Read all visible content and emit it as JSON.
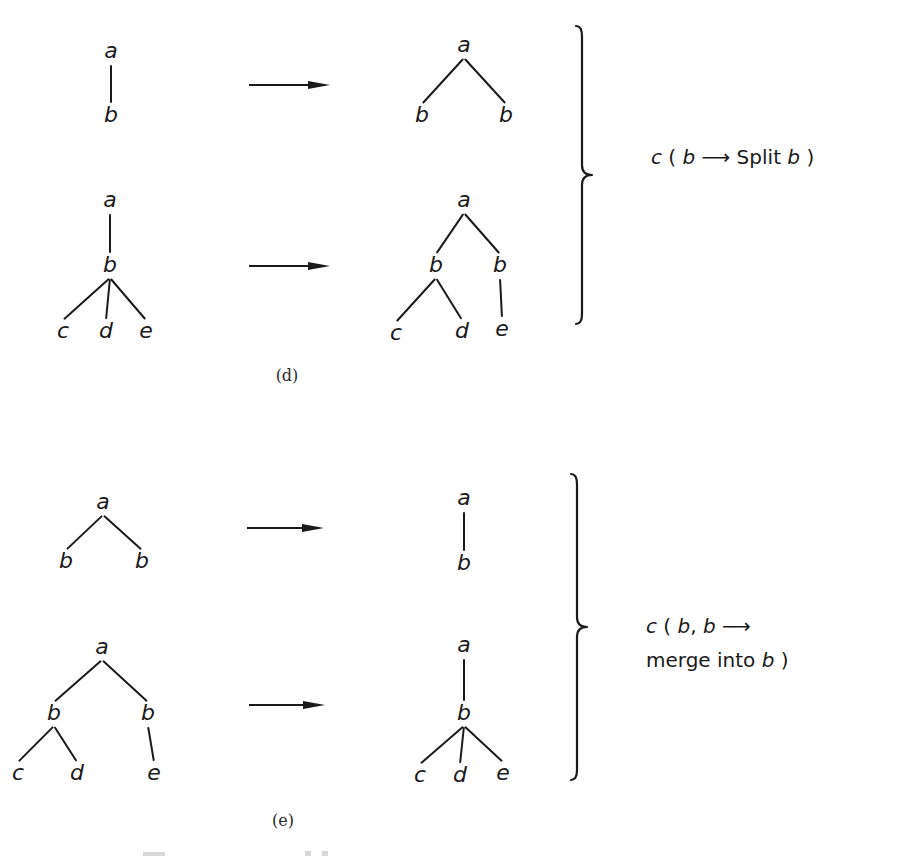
{
  "figure": {
    "panels": [
      {
        "id": "d",
        "label": "(d)",
        "rule": {
          "lines": [
            [
              {
                "text": "c",
                "italic": true
              },
              {
                "text": " ( ",
                "italic": false
              },
              {
                "text": "b",
                "italic": true
              },
              {
                "text": " ",
                "italic": false
              },
              {
                "text": "→",
                "italic": false,
                "arrow": true
              },
              {
                "text": " Split ",
                "italic": false
              },
              {
                "text": "b",
                "italic": true
              },
              {
                "text": " )",
                "italic": false
              }
            ]
          ],
          "plain": "c ( b → Split b )"
        },
        "transformations": [
          {
            "before": {
              "nodes": [
                {
                  "id": "a",
                  "label": "a"
                },
                {
                  "id": "b",
                  "label": "b"
                }
              ],
              "edges": [
                [
                  "a",
                  "b"
                ]
              ]
            },
            "after": {
              "nodes": [
                {
                  "id": "a",
                  "label": "a"
                },
                {
                  "id": "b1",
                  "label": "b"
                },
                {
                  "id": "b2",
                  "label": "b"
                }
              ],
              "edges": [
                [
                  "a",
                  "b1"
                ],
                [
                  "a",
                  "b2"
                ]
              ]
            }
          },
          {
            "before": {
              "nodes": [
                {
                  "id": "a",
                  "label": "a"
                },
                {
                  "id": "b",
                  "label": "b"
                },
                {
                  "id": "c",
                  "label": "c"
                },
                {
                  "id": "d",
                  "label": "d"
                },
                {
                  "id": "e",
                  "label": "e"
                }
              ],
              "edges": [
                [
                  "a",
                  "b"
                ],
                [
                  "b",
                  "c"
                ],
                [
                  "b",
                  "d"
                ],
                [
                  "b",
                  "e"
                ]
              ]
            },
            "after": {
              "nodes": [
                {
                  "id": "a",
                  "label": "a"
                },
                {
                  "id": "b1",
                  "label": "b"
                },
                {
                  "id": "b2",
                  "label": "b"
                },
                {
                  "id": "c",
                  "label": "c"
                },
                {
                  "id": "d",
                  "label": "d"
                },
                {
                  "id": "e",
                  "label": "e"
                }
              ],
              "edges": [
                [
                  "a",
                  "b1"
                ],
                [
                  "a",
                  "b2"
                ],
                [
                  "b1",
                  "c"
                ],
                [
                  "b1",
                  "d"
                ],
                [
                  "b2",
                  "e"
                ]
              ]
            }
          }
        ]
      },
      {
        "id": "e",
        "label": "(e)",
        "rule": {
          "lines": [
            [
              {
                "text": "c",
                "italic": true
              },
              {
                "text": " ( ",
                "italic": false
              },
              {
                "text": "b",
                "italic": true
              },
              {
                "text": ", ",
                "italic": false
              },
              {
                "text": "b",
                "italic": true
              },
              {
                "text": " ",
                "italic": false
              },
              {
                "text": "→",
                "italic": false,
                "arrow": true
              }
            ],
            [
              {
                "text": "merge into ",
                "italic": false
              },
              {
                "text": "b",
                "italic": true
              },
              {
                "text": " )",
                "italic": false
              }
            ]
          ],
          "plain": "c ( b, b → merge into b )"
        },
        "transformations": [
          {
            "before": {
              "nodes": [
                {
                  "id": "a",
                  "label": "a"
                },
                {
                  "id": "b1",
                  "label": "b"
                },
                {
                  "id": "b2",
                  "label": "b"
                }
              ],
              "edges": [
                [
                  "a",
                  "b1"
                ],
                [
                  "a",
                  "b2"
                ]
              ]
            },
            "after": {
              "nodes": [
                {
                  "id": "a",
                  "label": "a"
                },
                {
                  "id": "b",
                  "label": "b"
                }
              ],
              "edges": [
                [
                  "a",
                  "b"
                ]
              ]
            }
          },
          {
            "before": {
              "nodes": [
                {
                  "id": "a",
                  "label": "a"
                },
                {
                  "id": "b1",
                  "label": "b"
                },
                {
                  "id": "b2",
                  "label": "b"
                },
                {
                  "id": "c",
                  "label": "c"
                },
                {
                  "id": "d",
                  "label": "d"
                },
                {
                  "id": "e",
                  "label": "e"
                }
              ],
              "edges": [
                [
                  "a",
                  "b1"
                ],
                [
                  "a",
                  "b2"
                ],
                [
                  "b1",
                  "c"
                ],
                [
                  "b1",
                  "d"
                ],
                [
                  "b2",
                  "e"
                ]
              ]
            },
            "after": {
              "nodes": [
                {
                  "id": "a",
                  "label": "a"
                },
                {
                  "id": "b",
                  "label": "b"
                },
                {
                  "id": "c",
                  "label": "c"
                },
                {
                  "id": "d",
                  "label": "d"
                },
                {
                  "id": "e",
                  "label": "e"
                }
              ],
              "edges": [
                [
                  "a",
                  "b"
                ],
                [
                  "b",
                  "c"
                ],
                [
                  "b",
                  "d"
                ],
                [
                  "b",
                  "e"
                ]
              ]
            }
          }
        ]
      }
    ]
  }
}
